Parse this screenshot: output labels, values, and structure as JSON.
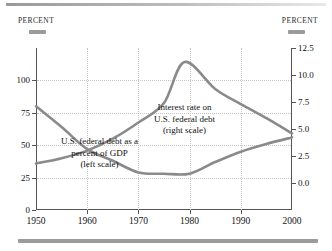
{
  "figure": {
    "left_axis_title": "Percent",
    "right_axis_title": "Percent",
    "left_swatch_name": "left-series-swatch",
    "right_swatch_name": "right-series-swatch"
  },
  "annotations": {
    "interest": {
      "line1": "Interest rate on",
      "line2": "U.S. federal debt",
      "line3": "(right scale)"
    },
    "debt": {
      "line1": "U.S. federal debt as a",
      "line2": "percent of GDP",
      "line3": "(left scale)"
    }
  },
  "colors": {
    "series": "#8a8a8a",
    "grid": "#c6c6c6",
    "axis": "#555555",
    "rule": "#9b9b9b",
    "text": "#111111"
  },
  "chart_data": {
    "type": "line",
    "title": "",
    "xlabel": "",
    "ylabel": "Percent",
    "grid": true,
    "legend": "annotations-inline",
    "x": [
      1950,
      1960,
      1970,
      1980,
      1990,
      2000
    ],
    "xlim": [
      1950,
      2000
    ],
    "xticks": [
      "1950",
      "1960",
      "1970",
      "1980",
      "1990",
      "2000"
    ],
    "left_axis": {
      "label": "Percent",
      "ylim": [
        0,
        125
      ],
      "yticks": [
        0,
        25,
        50,
        75,
        100
      ],
      "ytick_labels": [
        "0",
        "25",
        "50",
        "75",
        "100"
      ]
    },
    "right_axis": {
      "label": "Percent",
      "ylim": [
        -2.5,
        12.5
      ],
      "yticks": [
        0.0,
        2.5,
        5.0,
        7.5,
        10.0,
        12.5
      ],
      "ytick_labels": [
        "0.0",
        "2.5",
        "5.0",
        "7.5",
        "10.0",
        "12.5"
      ]
    },
    "series": [
      {
        "name": "U.S. federal debt as a percent of GDP",
        "axis": "left",
        "annotation": "U.S. federal debt as a percent of GDP (left scale)",
        "x": [
          1950,
          1955,
          1960,
          1965,
          1970,
          1975,
          1980,
          1985,
          1990,
          1995,
          2000
        ],
        "values": [
          80,
          64,
          47,
          38,
          29,
          28,
          28,
          37,
          45,
          51,
          56
        ]
      },
      {
        "name": "Interest rate on U.S. federal debt",
        "axis": "right",
        "annotation": "Interest rate on U.S. federal debt (right scale)",
        "x": [
          1950,
          1955,
          1960,
          1965,
          1970,
          1975,
          1979,
          1985,
          1990,
          1995,
          2000
        ],
        "values": [
          1.8,
          2.3,
          3.0,
          4.1,
          5.6,
          7.4,
          11.2,
          8.7,
          7.3,
          6.0,
          4.6
        ]
      }
    ]
  }
}
